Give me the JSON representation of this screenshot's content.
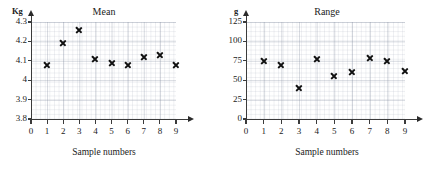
{
  "chart_data": [
    {
      "type": "scatter",
      "id": "mean",
      "title": "Mean",
      "xlabel": "Sample numbers",
      "ylabel": "",
      "yunit": "Kg",
      "xticks": [
        "0",
        "1",
        "2",
        "3",
        "4",
        "5",
        "6",
        "7",
        "8",
        "9"
      ],
      "yticks": [
        "3.8",
        "3.9",
        "4",
        "4.1",
        "4.2",
        "4.3"
      ],
      "xlim": [
        0,
        9
      ],
      "ylim": [
        3.8,
        4.3
      ],
      "grid": true,
      "legend": "none",
      "marker": "x",
      "x": [
        1,
        2,
        3,
        4,
        5,
        6,
        7,
        8,
        9
      ],
      "values": [
        4.08,
        4.19,
        4.26,
        4.11,
        4.09,
        4.08,
        4.12,
        4.13,
        4.08
      ]
    },
    {
      "type": "scatter",
      "id": "range",
      "title": "Range",
      "xlabel": "Sample numbers",
      "ylabel": "",
      "yunit": "g",
      "xticks": [
        "0",
        "1",
        "2",
        "3",
        "4",
        "5",
        "6",
        "7",
        "8",
        "9"
      ],
      "yticks": [
        "0",
        "25",
        "50",
        "75",
        "100",
        "125"
      ],
      "xlim": [
        0,
        9
      ],
      "ylim": [
        0,
        125
      ],
      "grid": true,
      "legend": "none",
      "marker": "x",
      "x": [
        1,
        2,
        3,
        4,
        5,
        6,
        7,
        8,
        9
      ],
      "values": [
        75,
        70,
        40,
        77,
        55,
        60,
        79,
        75,
        62
      ]
    }
  ],
  "colors": {
    "marker": "#111111",
    "axis": "#3b3b3b",
    "grid_major": "#7882 96",
    "background": "#ffffff"
  }
}
